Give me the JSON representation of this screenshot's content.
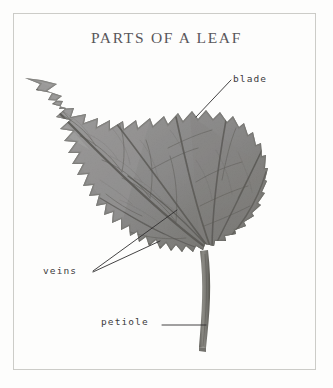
{
  "figure": {
    "title": "PARTS OF A LEAF",
    "background_color": "#fdfdfc",
    "frame_color": "#cfcfcb",
    "title_color": "#59565a",
    "label_color": "#3c3a3c"
  },
  "labels": {
    "blade": "blade",
    "veins": "veins",
    "petiole": "petiole"
  },
  "leaf": {
    "blade_fill": "#8e8d8c",
    "blade_shadow": "#6f6e6d",
    "vein_color": "#5a5957",
    "petiole_color": "#7b7a76",
    "midrib_color": "#55544f"
  },
  "annotations": [
    {
      "name": "blade",
      "leader_from": [
        231,
        80
      ],
      "leader_to": [
        196,
        117
      ]
    },
    {
      "name": "veins",
      "leader_from": [
        93,
        271
      ],
      "leader_to": [
        176,
        211
      ]
    },
    {
      "name": "veins",
      "leader_from": [
        93,
        272
      ],
      "leader_to": [
        160,
        240
      ]
    },
    {
      "name": "petiole",
      "leader_from": [
        162,
        325
      ],
      "leader_to": [
        206,
        325
      ]
    }
  ]
}
